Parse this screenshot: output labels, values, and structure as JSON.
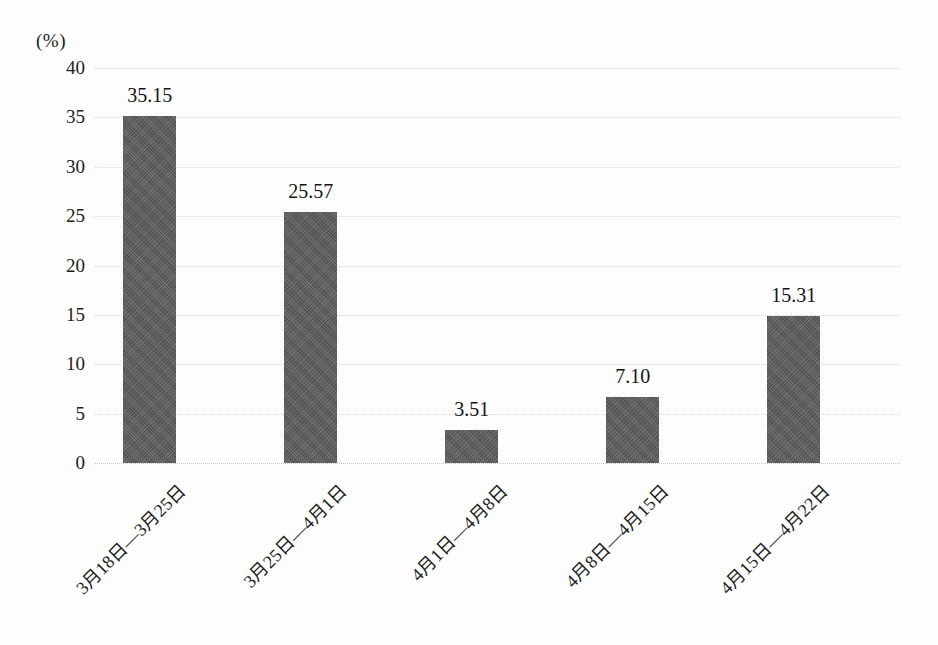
{
  "axis": {
    "unit_label": "(%)",
    "y_ticks": [
      "40",
      "35",
      "30",
      "25",
      "20",
      "15",
      "10",
      "5",
      "0"
    ]
  },
  "style": {
    "bar_color": "#5b5b5b",
    "gridline_color": "#d6d6d6",
    "background_color": "#fdfdfd",
    "text_color": "#1a1a1a"
  },
  "chart_data": {
    "type": "bar",
    "title": "",
    "subtitle": "",
    "xlabel": "",
    "ylabel": "(%)",
    "ylim": [
      0,
      40
    ],
    "ytick_step": 5,
    "grid": true,
    "legend": null,
    "categories": [
      "3月18日—3月25日",
      "3月25日—4月1日",
      "4月1日—4月8日",
      "4月8日—4月15日",
      "4月15日—4月22日"
    ],
    "values": [
      35.15,
      25.57,
      3.51,
      7.1,
      15.31
    ],
    "value_labels": [
      "35.15",
      "25.57",
      "3.51",
      "7.10",
      "15.31"
    ],
    "drawn_values": [
      35.15,
      25.4,
      3.3,
      6.7,
      14.9
    ]
  }
}
